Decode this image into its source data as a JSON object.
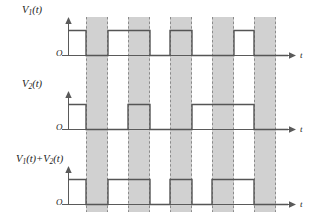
{
  "figure": {
    "width": 312,
    "height": 221,
    "band_fill": "#c9c9c9",
    "band_stroke": "#8a8a8a",
    "axis_color": "#5a5a5a",
    "wave_color": "#555555",
    "background": "#ffffff"
  },
  "panels": [
    {
      "id": "panel-v1",
      "label": "V₁(t)",
      "label_parts": {
        "base": "V",
        "sub": "1",
        "arg": "(t)"
      },
      "origin_label": "O",
      "axis_label": "t",
      "origin_x": 68,
      "baseline_y": 55,
      "high_y": 30,
      "axis_top_y": 17,
      "axis_end_x": 296,
      "levels": [
        {
          "from": 68,
          "to": 86,
          "value": 1
        },
        {
          "from": 86,
          "to": 108,
          "value": 0
        },
        {
          "from": 108,
          "to": 150,
          "value": 1
        },
        {
          "from": 150,
          "to": 170,
          "value": 0
        },
        {
          "from": 170,
          "to": 192,
          "value": 1
        },
        {
          "from": 192,
          "to": 234,
          "value": 0
        },
        {
          "from": 234,
          "to": 254,
          "value": 1
        },
        {
          "from": 254,
          "to": 276,
          "value": 0
        },
        {
          "from": 276,
          "to": 288,
          "value": 0
        }
      ]
    },
    {
      "id": "panel-v2",
      "label": "V₂(t)",
      "label_parts": {
        "base": "V",
        "sub": "2",
        "arg": "(t)"
      },
      "origin_label": "O",
      "axis_label": "t",
      "origin_x": 68,
      "baseline_y": 129,
      "high_y": 104,
      "axis_top_y": 91,
      "axis_end_x": 296,
      "levels": [
        {
          "from": 68,
          "to": 86,
          "value": 1
        },
        {
          "from": 86,
          "to": 128,
          "value": 0
        },
        {
          "from": 128,
          "to": 150,
          "value": 1
        },
        {
          "from": 150,
          "to": 192,
          "value": 0
        },
        {
          "from": 192,
          "to": 254,
          "value": 1
        },
        {
          "from": 254,
          "to": 288,
          "value": 0
        }
      ]
    },
    {
      "id": "panel-sum",
      "label": "V₁(t)+V₂(t)",
      "label_parts": {
        "base": "V",
        "sub": "1",
        "arg": "(t)",
        "op": "+",
        "base2": "V",
        "sub2": "2",
        "arg2": "(t)"
      },
      "origin_label": "O",
      "axis_label": "t",
      "origin_x": 68,
      "baseline_y": 204,
      "high_y": 179,
      "axis_top_y": 166,
      "axis_end_x": 296,
      "levels": [
        {
          "from": 68,
          "to": 86,
          "value": 1
        },
        {
          "from": 86,
          "to": 108,
          "value": 0
        },
        {
          "from": 108,
          "to": 150,
          "value": 1
        },
        {
          "from": 150,
          "to": 170,
          "value": 0
        },
        {
          "from": 170,
          "to": 192,
          "value": 1
        },
        {
          "from": 192,
          "to": 212,
          "value": 0
        },
        {
          "from": 212,
          "to": 254,
          "value": 1
        },
        {
          "from": 254,
          "to": 276,
          "value": 0
        },
        {
          "from": 276,
          "to": 288,
          "value": 0
        }
      ]
    }
  ],
  "bands": [
    {
      "index": 1,
      "x": 86,
      "width": 22
    },
    {
      "index": 2,
      "x": 128,
      "width": 22
    },
    {
      "index": 3,
      "x": 170,
      "width": 22
    },
    {
      "index": 4,
      "x": 212,
      "width": 22
    },
    {
      "index": 5,
      "x": 254,
      "width": 22
    }
  ],
  "band_span": {
    "top": 17,
    "bottom": 212
  },
  "chart_data": {
    "type": "line",
    "xlabel": "t",
    "ylabel": "",
    "series": [
      {
        "name": "V₁(t)",
        "x": [
          68,
          86,
          86,
          108,
          108,
          150,
          150,
          170,
          170,
          192,
          192,
          234,
          234,
          254,
          254,
          288
        ],
        "values": [
          1,
          1,
          0,
          0,
          1,
          1,
          0,
          0,
          1,
          1,
          0,
          0,
          1,
          1,
          0,
          0
        ]
      },
      {
        "name": "V₂(t)",
        "x": [
          68,
          86,
          86,
          128,
          128,
          150,
          150,
          192,
          192,
          254,
          254,
          288
        ],
        "values": [
          1,
          1,
          0,
          0,
          1,
          1,
          0,
          0,
          1,
          1,
          0,
          0
        ]
      },
      {
        "name": "V₁(t)+V₂(t)",
        "x": [
          68,
          86,
          86,
          108,
          108,
          150,
          150,
          170,
          170,
          192,
          192,
          212,
          212,
          254,
          254,
          288
        ],
        "values": [
          1,
          1,
          0,
          0,
          1,
          1,
          0,
          0,
          1,
          1,
          0,
          0,
          1,
          1,
          0,
          0
        ]
      }
    ],
    "shaded_intervals": [
      [
        86,
        108
      ],
      [
        128,
        150
      ],
      [
        170,
        192
      ],
      [
        212,
        234
      ],
      [
        254,
        276
      ]
    ],
    "ylim": [
      0,
      1
    ],
    "grid": false,
    "legend": "none"
  }
}
